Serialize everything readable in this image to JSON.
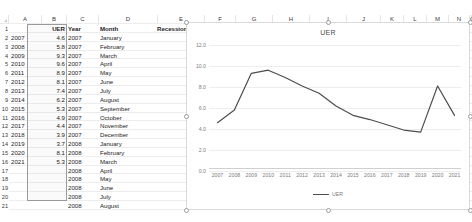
{
  "spreadsheet": {
    "column_headers": [
      "A",
      "B",
      "C",
      "D",
      "E",
      "F",
      "G",
      "H",
      "I",
      "J",
      "K",
      "L",
      "M",
      "N",
      "O"
    ],
    "row_numbers": [
      "1",
      "2",
      "3",
      "4",
      "5",
      "6",
      "7",
      "8",
      "9",
      "10",
      "11",
      "12",
      "13",
      "14",
      "15",
      "16",
      "17",
      "18",
      "19",
      "20",
      "21"
    ],
    "header_row": {
      "a": "",
      "b": "UER",
      "c": "Year",
      "d": "Month",
      "e": "Recession"
    },
    "rows": [
      {
        "a": "2007",
        "b": "4.6",
        "c": "2007",
        "d": "January",
        "e": ""
      },
      {
        "a": "2008",
        "b": "5.8",
        "c": "2007",
        "d": "February",
        "e": ""
      },
      {
        "a": "2009",
        "b": "9.3",
        "c": "2007",
        "d": "March",
        "e": ""
      },
      {
        "a": "2010",
        "b": "9.6",
        "c": "2007",
        "d": "April",
        "e": ""
      },
      {
        "a": "2011",
        "b": "8.9",
        "c": "2007",
        "d": "May",
        "e": ""
      },
      {
        "a": "2012",
        "b": "8.1",
        "c": "2007",
        "d": "June",
        "e": ""
      },
      {
        "a": "2013",
        "b": "7.4",
        "c": "2007",
        "d": "July",
        "e": ""
      },
      {
        "a": "2014",
        "b": "6.2",
        "c": "2007",
        "d": "August",
        "e": ""
      },
      {
        "a": "2015",
        "b": "5.3",
        "c": "2007",
        "d": "September",
        "e": ""
      },
      {
        "a": "2016",
        "b": "4.9",
        "c": "2007",
        "d": "October",
        "e": ""
      },
      {
        "a": "2017",
        "b": "4.4",
        "c": "2007",
        "d": "November",
        "e": ""
      },
      {
        "a": "2018",
        "b": "3.9",
        "c": "2007",
        "d": "December",
        "e": "1"
      },
      {
        "a": "2019",
        "b": "3.7",
        "c": "2008",
        "d": "January",
        "e": "1"
      },
      {
        "a": "2020",
        "b": "8.1",
        "c": "2008",
        "d": "February",
        "e": "1"
      },
      {
        "a": "2021",
        "b": "5.3",
        "c": "2008",
        "d": "March",
        "e": "1"
      },
      {
        "a": "",
        "b": "",
        "c": "2008",
        "d": "April",
        "e": "1"
      },
      {
        "a": "",
        "b": "",
        "c": "2008",
        "d": "May",
        "e": "1"
      },
      {
        "a": "",
        "b": "",
        "c": "2008",
        "d": "June",
        "e": "1"
      },
      {
        "a": "",
        "b": "",
        "c": "2008",
        "d": "July",
        "e": "1"
      },
      {
        "a": "",
        "b": "",
        "c": "2008",
        "d": "August",
        "e": "1"
      }
    ]
  },
  "chart_data": {
    "type": "line",
    "title": "UER",
    "xlabel": "",
    "ylabel": "",
    "grid": true,
    "legend_position": "bottom",
    "categories": [
      "2007",
      "2008",
      "2009",
      "2010",
      "2011",
      "2012",
      "2013",
      "2014",
      "2015",
      "2016",
      "2017",
      "2018",
      "2019",
      "2020",
      "2021"
    ],
    "series": [
      {
        "name": "UER",
        "color": "#4d4d4d",
        "values": [
          4.6,
          5.8,
          9.3,
          9.6,
          8.9,
          8.1,
          7.4,
          6.2,
          5.3,
          4.9,
          4.4,
          3.9,
          3.7,
          8.1,
          5.3
        ]
      }
    ],
    "ylim": [
      0,
      12
    ],
    "ytick_step": 2,
    "yticks": [
      "0.0",
      "2.0",
      "4.0",
      "6.0",
      "8.0",
      "10.0",
      "12.0"
    ]
  },
  "colors": {
    "series_line": "#4d4d4d",
    "gridline": "#ededed",
    "axis_text": "#7d7d7d",
    "chart_border": "#d9d9d9",
    "handle_stroke": "#9b9b9b"
  }
}
